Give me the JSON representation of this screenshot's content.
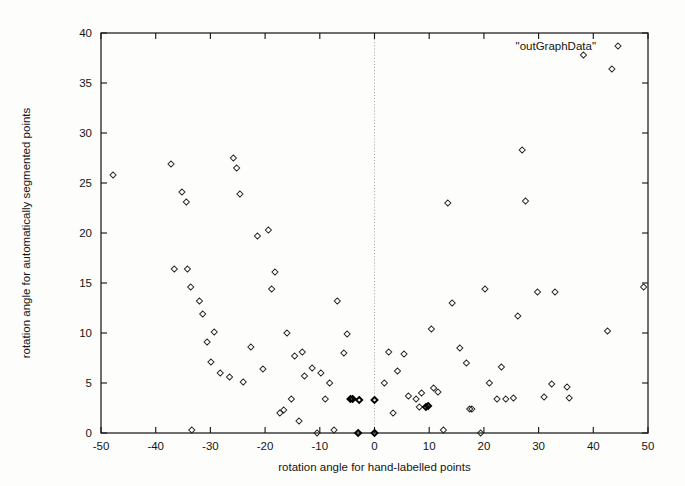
{
  "chart_data": {
    "type": "scatter",
    "title": "",
    "xlabel": "rotation angle for hand-labelled points",
    "ylabel": "rotation angle for automatically segmented points",
    "xlim": [
      -50,
      50
    ],
    "ylim": [
      0,
      40
    ],
    "xticks": [
      -50,
      -40,
      -30,
      -20,
      -10,
      0,
      10,
      20,
      30,
      40,
      50
    ],
    "yticks": [
      0,
      5,
      10,
      15,
      20,
      25,
      30,
      35,
      40
    ],
    "xtick_labels": [
      "-50",
      "-40",
      "-30",
      "-20",
      "-10",
      "0",
      "10",
      "20",
      "30",
      "40",
      "50"
    ],
    "ytick_labels": [
      "0",
      "5",
      "10",
      "15",
      "20",
      "25",
      "30",
      "35",
      "40"
    ],
    "grid": false,
    "zero_reference_line": {
      "axis": "x",
      "value": 0,
      "style": "dotted"
    },
    "legend": {
      "position": "top-right-inside",
      "entries": [
        {
          "label": "\"outGraphData\"",
          "marker": "diamond",
          "color": "#222222"
        }
      ]
    },
    "marker_style": "open-diamond",
    "marker_color": "#222222",
    "series": [
      {
        "name": "\"outGraphData\"",
        "points": [
          [
            -47.8,
            25.8
          ],
          [
            -37.2,
            26.9
          ],
          [
            -36.6,
            16.4
          ],
          [
            -35.2,
            24.1
          ],
          [
            -34.4,
            23.1
          ],
          [
            -34.2,
            16.4
          ],
          [
            -33.6,
            14.6
          ],
          [
            -33.4,
            0.3
          ],
          [
            -32.0,
            13.2
          ],
          [
            -31.4,
            11.9
          ],
          [
            -30.6,
            9.1
          ],
          [
            -29.9,
            7.1
          ],
          [
            -29.3,
            10.1
          ],
          [
            -28.2,
            6.0
          ],
          [
            -26.5,
            5.6
          ],
          [
            -25.8,
            27.5
          ],
          [
            -25.2,
            26.5
          ],
          [
            -24.6,
            23.9
          ],
          [
            -24.0,
            5.1
          ],
          [
            -22.6,
            8.6
          ],
          [
            -21.4,
            19.7
          ],
          [
            -20.4,
            6.4
          ],
          [
            -19.4,
            20.3
          ],
          [
            -18.8,
            14.4
          ],
          [
            -18.2,
            16.1
          ],
          [
            -17.3,
            2.0
          ],
          [
            -16.6,
            2.3
          ],
          [
            -16.0,
            10.0
          ],
          [
            -15.2,
            3.4
          ],
          [
            -14.6,
            7.7
          ],
          [
            -13.8,
            1.2
          ],
          [
            -13.2,
            8.1
          ],
          [
            -12.8,
            5.7
          ],
          [
            -11.4,
            6.5
          ],
          [
            -10.5,
            0.0
          ],
          [
            -9.8,
            6.0
          ],
          [
            -9.0,
            3.4
          ],
          [
            -8.2,
            5.0
          ],
          [
            -7.4,
            0.3
          ],
          [
            -6.8,
            13.2
          ],
          [
            -5.6,
            8.0
          ],
          [
            -5.0,
            9.9
          ],
          [
            -4.4,
            3.4
          ],
          [
            -4.0,
            3.4
          ],
          [
            -3.0,
            0.0
          ],
          [
            -2.8,
            3.3
          ],
          [
            0.0,
            3.3
          ],
          [
            0.0,
            0.0
          ],
          [
            1.8,
            5.0
          ],
          [
            2.6,
            8.1
          ],
          [
            3.4,
            2.0
          ],
          [
            4.2,
            6.2
          ],
          [
            5.4,
            7.9
          ],
          [
            6.2,
            3.7
          ],
          [
            7.6,
            3.4
          ],
          [
            8.2,
            2.6
          ],
          [
            8.6,
            4.0
          ],
          [
            9.4,
            2.6
          ],
          [
            9.8,
            2.7
          ],
          [
            10.4,
            10.4
          ],
          [
            10.8,
            4.5
          ],
          [
            11.6,
            4.1
          ],
          [
            12.6,
            0.3
          ],
          [
            13.4,
            23.0
          ],
          [
            14.2,
            13.0
          ],
          [
            15.6,
            8.5
          ],
          [
            16.8,
            7.0
          ],
          [
            17.4,
            2.4
          ],
          [
            17.8,
            2.4
          ],
          [
            19.4,
            0.0
          ],
          [
            20.2,
            14.4
          ],
          [
            21.0,
            5.0
          ],
          [
            22.4,
            3.4
          ],
          [
            23.2,
            6.6
          ],
          [
            24.0,
            3.4
          ],
          [
            25.4,
            3.5
          ],
          [
            26.2,
            11.7
          ],
          [
            27.0,
            28.3
          ],
          [
            27.6,
            23.2
          ],
          [
            29.8,
            14.1
          ],
          [
            31.0,
            3.6
          ],
          [
            32.4,
            4.9
          ],
          [
            33.0,
            14.1
          ],
          [
            35.2,
            4.6
          ],
          [
            35.6,
            3.5
          ],
          [
            38.2,
            37.8
          ],
          [
            42.6,
            10.2
          ],
          [
            43.4,
            36.4
          ],
          [
            49.2,
            14.6
          ]
        ]
      }
    ],
    "emphasized_points": [
      [
        -4.4,
        3.4
      ],
      [
        -4.0,
        3.4
      ],
      [
        -3.0,
        0.0
      ],
      [
        -2.8,
        3.3
      ],
      [
        0.0,
        3.3
      ],
      [
        0.0,
        0.0
      ],
      [
        9.4,
        2.6
      ],
      [
        9.8,
        2.7
      ]
    ]
  }
}
